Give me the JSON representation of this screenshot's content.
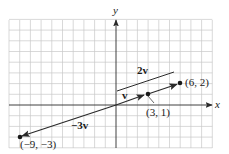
{
  "figure": {
    "type": "vector-diagram",
    "axes": {
      "x_label": "x",
      "y_label": "y",
      "x_range": [
        -10,
        9
      ],
      "y_range": [
        -4,
        8
      ],
      "grid": true,
      "grid_color": "#c8c8c8",
      "axis_color": "#2a2a2a"
    },
    "points": [
      {
        "id": "p1",
        "x": 3,
        "y": 1,
        "label": "(3, 1)"
      },
      {
        "id": "p2",
        "x": 6,
        "y": 2,
        "label": "(6, 2)"
      },
      {
        "id": "p3",
        "x": -9,
        "y": -3,
        "label": "(−9, −3)"
      }
    ],
    "vectors": [
      {
        "id": "v",
        "from": [
          0,
          0
        ],
        "to": [
          3,
          1
        ],
        "label": "v"
      },
      {
        "id": "2v",
        "from": [
          0,
          0
        ],
        "to": [
          6,
          2
        ],
        "label": "2v"
      },
      {
        "id": "-3v",
        "from": [
          0,
          0
        ],
        "to": [
          -9,
          -3
        ],
        "label": "−3v"
      }
    ],
    "labels": {
      "v": "v",
      "two_v": "2v",
      "neg_three_v": "−3v",
      "p1": "(3, 1)",
      "p2": "(6, 2)",
      "p3": "(−9, −3)",
      "x_axis": "x",
      "y_axis": "y"
    },
    "colors": {
      "vector": "#2a2a2a",
      "point": "#1a1a1a",
      "text": "#1a1a1a"
    }
  }
}
